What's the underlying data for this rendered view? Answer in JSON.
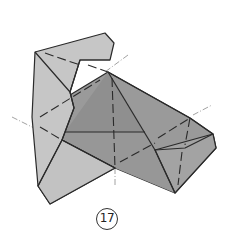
{
  "diagram": {
    "type": "origami-fold-step",
    "step_number": "17",
    "colors": {
      "background": "#ffffff",
      "light_paper": "#c6c6c6",
      "mid_paper": "#b4b4b4",
      "dark_paper": "#9a9a9a",
      "darker_paper": "#8f8f8f",
      "edge": "#2a2a2a",
      "fold_line": "#2a2a2a",
      "axis_line": "#8a8a8a"
    },
    "line_types": [
      "solid edge",
      "dashed valley fold",
      "dash-dot axis line"
    ]
  }
}
